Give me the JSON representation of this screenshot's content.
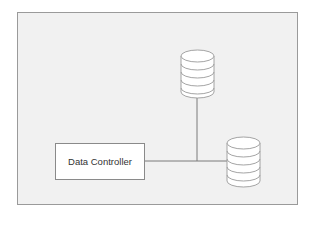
{
  "diagram": {
    "frame": {
      "background": "#f1f1f1",
      "border": "#9a9a9a"
    },
    "nodes": [
      {
        "id": "controller",
        "type": "box",
        "label": "Data Controller"
      },
      {
        "id": "db-top",
        "type": "database-cylinder",
        "label": ""
      },
      {
        "id": "db-bottom",
        "type": "database-cylinder",
        "label": ""
      }
    ],
    "edges": [
      {
        "from": "controller",
        "to": "db-bottom"
      },
      {
        "from": "db-top",
        "to": "junction"
      }
    ],
    "stroke_color": "#7a7a7a"
  }
}
